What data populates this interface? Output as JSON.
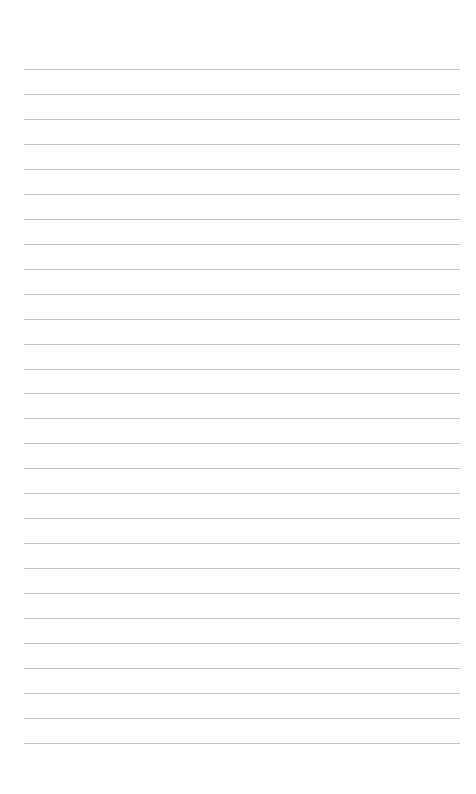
{
  "page": {
    "type": "lined-paper",
    "background": "#ffffff",
    "line_color": "#c4c4c4",
    "line_count": 28,
    "first_line_y": 69,
    "line_spacing": 24.96,
    "line_left": 24,
    "line_width": 436
  }
}
